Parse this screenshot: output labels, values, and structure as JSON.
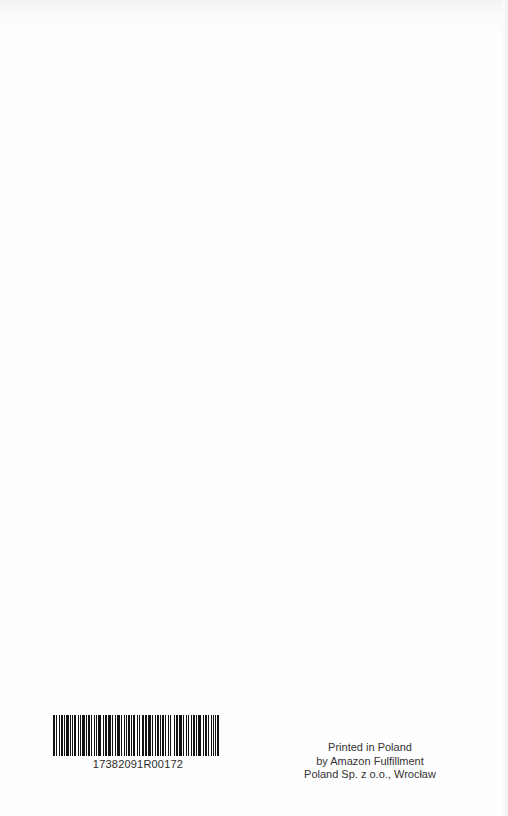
{
  "page": {
    "background": "#fefefe"
  },
  "barcode": {
    "number": "17382091R00172",
    "bar_color": "#111111",
    "pattern": [
      2,
      1,
      1,
      2,
      1,
      1,
      2,
      1,
      1,
      1,
      3,
      1,
      1,
      2,
      1,
      1,
      2,
      2,
      1,
      1,
      1,
      1,
      3,
      1,
      1,
      1,
      2,
      1,
      1,
      2,
      1,
      1,
      1,
      1,
      3,
      2,
      1,
      1,
      2,
      1,
      1,
      1,
      2,
      1,
      1,
      2,
      1,
      1,
      3,
      1,
      1,
      2,
      1,
      1,
      1,
      1,
      2,
      1,
      1,
      1,
      2,
      2,
      1,
      1,
      1,
      2,
      1,
      1,
      1,
      1,
      2,
      1,
      3,
      1,
      1,
      2,
      1,
      1,
      2,
      1,
      1,
      1,
      2,
      1,
      1,
      2,
      1,
      1,
      1,
      3,
      1,
      1,
      2,
      1,
      1,
      1,
      2,
      1,
      1,
      2,
      1,
      1,
      1,
      2,
      1,
      1,
      2,
      1,
      1,
      1,
      3,
      2,
      1,
      1,
      2,
      1,
      1,
      2,
      1,
      1,
      1,
      2,
      1,
      1,
      2,
      1
    ]
  },
  "imprint": {
    "line1": "Printed in Poland",
    "line2": "by Amazon Fulfillment",
    "line3": "Poland Sp. z o.o., Wrocław"
  }
}
